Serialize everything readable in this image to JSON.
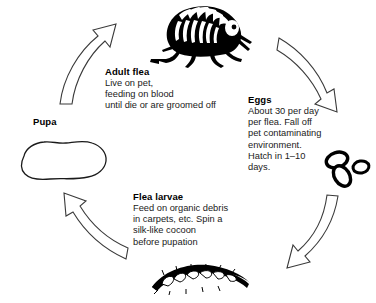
{
  "diagram": {
    "type": "cycle-diagram",
    "direction": "clockwise",
    "background_color": "#ffffff",
    "ink_color": "#000000",
    "stages": [
      {
        "id": "adult-flea",
        "heading": "Adult flea",
        "body": "Live on pet,\nfeeding on blood\nuntil die or are groomed off",
        "illustration": "adult-flea-illustration",
        "position": "top"
      },
      {
        "id": "eggs",
        "heading": "Eggs",
        "body": "About 30 per day\nper flea. Fall off\npet contaminating\nenvironment.\nHatch in 1–10\ndays.",
        "illustration": "flea-eggs-illustration",
        "position": "right"
      },
      {
        "id": "flea-larvae",
        "heading": "Flea larvae",
        "body": "Feed on organic debris\nin carpets, etc. Spin a\nsilk-like cocoon\nbefore pupation",
        "illustration": "flea-larva-illustration",
        "position": "bottom"
      },
      {
        "id": "pupa",
        "heading": "Pupa",
        "body": "",
        "illustration": "pupa-cocoon-illustration",
        "position": "left"
      }
    ],
    "arrows": [
      {
        "id": "arrow-adult-to-eggs",
        "from": "adult-flea",
        "to": "eggs",
        "style": "hollow-outline-curved"
      },
      {
        "id": "arrow-eggs-to-larvae",
        "from": "eggs",
        "to": "flea-larvae",
        "style": "hollow-outline-curved"
      },
      {
        "id": "arrow-larvae-to-pupa",
        "from": "flea-larvae",
        "to": "pupa",
        "style": "hollow-outline-curved"
      },
      {
        "id": "arrow-pupa-to-adult",
        "from": "pupa",
        "to": "adult-flea",
        "style": "hollow-outline-curved"
      }
    ]
  }
}
